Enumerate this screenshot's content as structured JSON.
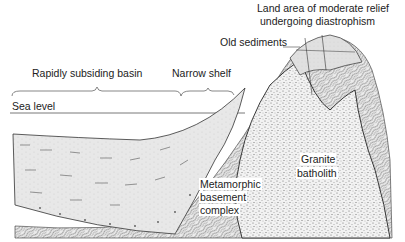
{
  "diagram": {
    "type": "geological-cross-section",
    "labels": {
      "land_area_line1": "Land area of moderate relief",
      "land_area_line2": "undergoing diastrophism",
      "old_sediments": "Old sediments",
      "rapidly_subsiding_basin": "Rapidly subsiding basin",
      "narrow_shelf": "Narrow shelf",
      "sea_level": "Sea level",
      "granite_line1": "Granite",
      "granite_line2": "batholith",
      "meta_line1": "Metamorphic",
      "meta_line2": "basement",
      "meta_line3": "complex"
    },
    "units": [
      {
        "name": "Basin sediments",
        "pattern": "fine stipple with dashes and dots"
      },
      {
        "name": "Metamorphic basement complex",
        "pattern": "wavy contorted lines"
      },
      {
        "name": "Granite batholith",
        "pattern": "dense stipple"
      },
      {
        "name": "Old sediments",
        "pattern": "light shading with fault lines"
      }
    ],
    "colors": {
      "ink": "#222222",
      "sediment_fill": "#e6e6e6",
      "granite_fill": "#f0f0f0",
      "old_sed_fill": "#e2e2e2"
    }
  }
}
